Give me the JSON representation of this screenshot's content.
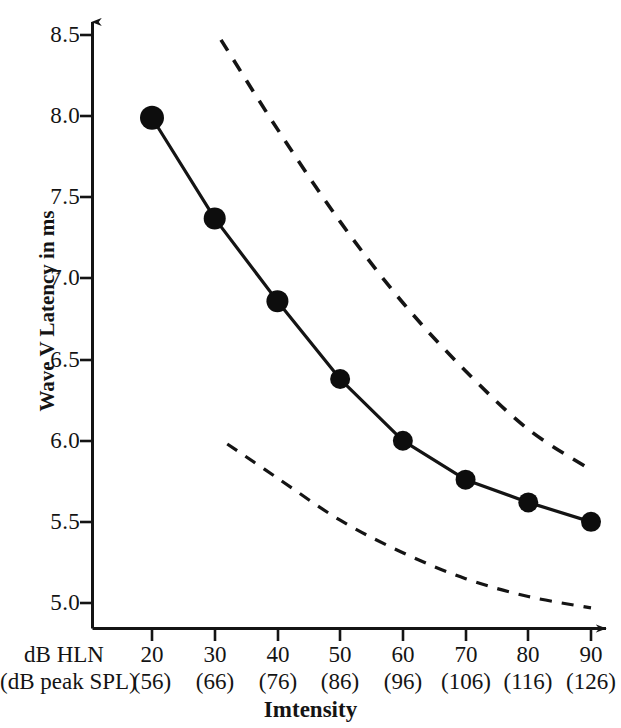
{
  "chart_data": {
    "type": "line",
    "title": "",
    "xlabel": "Imtensity",
    "ylabel": "Wave V Latency in ms",
    "x_row_labels": [
      "dB HLN",
      "(dB peak SPL)"
    ],
    "categories": [
      "20",
      "30",
      "40",
      "50",
      "60",
      "70",
      "80",
      "90"
    ],
    "secondary_categories": [
      "(56)",
      "(66)",
      "(76)",
      "(86)",
      "(96)",
      "(106)",
      "(116)",
      "(126)"
    ],
    "xlim": [
      15,
      95
    ],
    "ylim": [
      4.85,
      8.62
    ],
    "yticks": [
      "5.0",
      "5.5",
      "6.0",
      "6.5",
      "7.0",
      "7.5",
      "8.0",
      "8.5"
    ],
    "ytick_values": [
      5.0,
      5.5,
      6.0,
      6.5,
      7.0,
      7.5,
      8.0,
      8.5
    ],
    "grid": false,
    "legend": "none",
    "axis_arrows": true,
    "series": [
      {
        "name": "Mean Wave V latency",
        "style": "solid-with-markers",
        "marker": "filled-circle",
        "x": [
          20,
          30,
          40,
          50,
          60,
          70,
          80,
          90
        ],
        "values": [
          7.99,
          7.37,
          6.86,
          6.38,
          6.0,
          5.76,
          5.62,
          5.5
        ]
      },
      {
        "name": "Upper normal limit",
        "style": "dashed",
        "marker": "none",
        "x": [
          31,
          40,
          50,
          60,
          70,
          80,
          90
        ],
        "values": [
          8.47,
          7.92,
          7.35,
          6.85,
          6.43,
          6.07,
          5.82
        ]
      },
      {
        "name": "Lower normal limit",
        "style": "dashed",
        "marker": "none",
        "x": [
          32,
          40,
          50,
          60,
          70,
          80,
          90
        ],
        "values": [
          5.98,
          5.77,
          5.51,
          5.31,
          5.15,
          5.04,
          4.97
        ]
      }
    ],
    "colors": {
      "line": "#141414",
      "marker": "#0d0d0d",
      "axis": "#141414",
      "background": "#ffffff"
    }
  },
  "icons": {
    "y_axis_arrow": "arrow-up-icon",
    "x_axis_arrow": "arrow-right-icon"
  }
}
